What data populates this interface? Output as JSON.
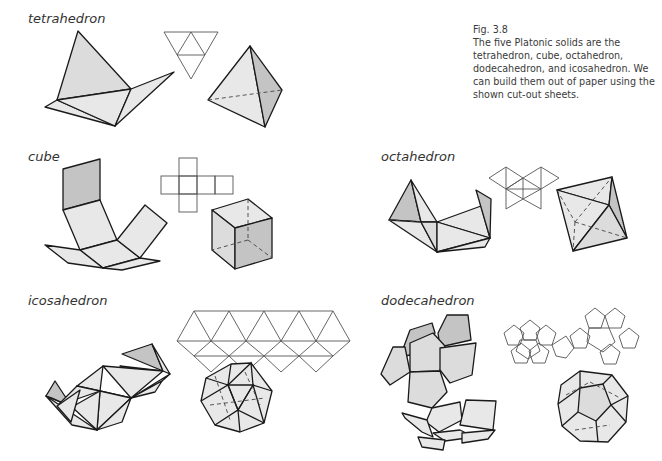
{
  "figure": {
    "number": "Fig. 3.8",
    "caption": "The five Platonic solids are the tetrahedron, cube, octahedron, dodecahedron, and icosahedron. We can build them out of paper using the shown cut-out sheets."
  },
  "panels": [
    {
      "id": "tetrahedron",
      "label": "tetrahedron",
      "faces": 4,
      "net": "triangle of 4 triangles"
    },
    {
      "id": "cube",
      "label": "cube",
      "faces": 6,
      "net": "cross of 6 squares"
    },
    {
      "id": "octahedron",
      "label": "octahedron",
      "faces": 8,
      "net": "8 triangles"
    },
    {
      "id": "icosahedron",
      "label": "icosahedron",
      "faces": 20,
      "net": "strip of 20 triangles"
    },
    {
      "id": "dodecahedron",
      "label": "dodecahedron",
      "faces": 12,
      "net": "two flowers of 6 pentagons"
    }
  ],
  "colors": {
    "face_fill": "#dcdcdc",
    "edge": "#1a1a1a",
    "net_line": "#555555",
    "text": "#333333"
  }
}
